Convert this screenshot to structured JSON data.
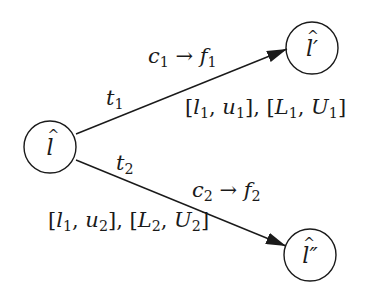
{
  "diagram": {
    "nodes": [
      {
        "id": "l",
        "label": "l",
        "prime": "",
        "cx": 50,
        "cy": 147,
        "r": 26
      },
      {
        "id": "l_prime",
        "label": "l",
        "prime": "′",
        "cx": 312,
        "cy": 48,
        "r": 26
      },
      {
        "id": "l_double_prime",
        "label": "l",
        "prime": "″",
        "cx": 310,
        "cy": 255,
        "r": 26
      }
    ],
    "edges": [
      {
        "from": "l",
        "to": "l_prime",
        "transition": {
          "base": "t",
          "sub": "1"
        },
        "action": {
          "c": "c",
          "c_sub": "1",
          "arrow": "→",
          "f": "f",
          "f_sub": "1"
        },
        "intervals": {
          "a": "l",
          "a_sub": "1",
          "b": "u",
          "b_sub": "1",
          "A": "L",
          "A_sub": "1",
          "B": "U",
          "B_sub": "1"
        }
      },
      {
        "from": "l",
        "to": "l_double_prime",
        "transition": {
          "base": "t",
          "sub": "2"
        },
        "action": {
          "c": "c",
          "c_sub": "2",
          "arrow": "→",
          "f": "f",
          "f_sub": "2"
        },
        "intervals": {
          "a": "l",
          "a_sub": "1",
          "b": "u",
          "b_sub": "2",
          "A": "L",
          "A_sub": "2",
          "B": "U",
          "B_sub": "2"
        }
      }
    ],
    "colors": {
      "stroke": "#1a1a1a",
      "background": "#ffffff"
    }
  }
}
